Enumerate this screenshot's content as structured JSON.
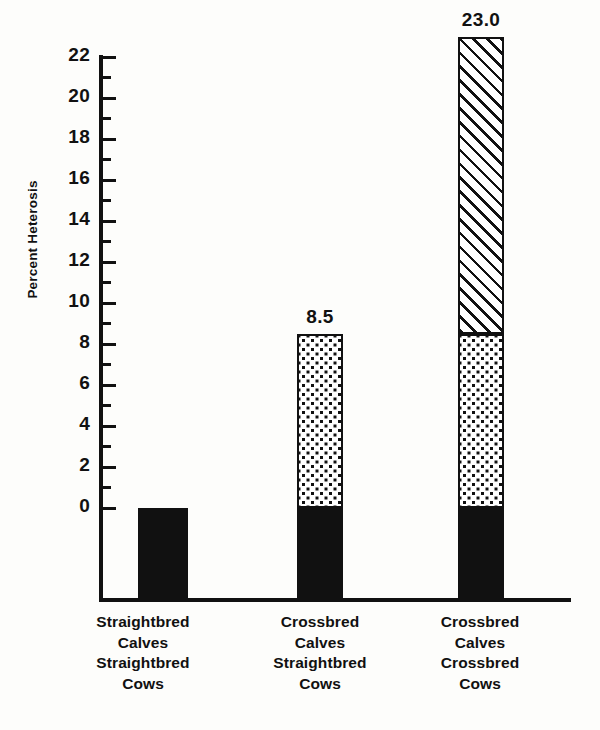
{
  "chart_data": {
    "type": "bar",
    "title": "",
    "subtitle": "",
    "xlabel": "",
    "ylabel": "Percent Heterosis",
    "ylim": [
      0,
      23
    ],
    "grid": false,
    "legend": "none",
    "stacked": true,
    "categories": [
      "Straightbred Calves Straightbred Cows",
      "Crossbred Calves Straightbred Cows",
      "Crossbred Calves Crossbred Cows"
    ],
    "category_lines": [
      [
        "Straightbred",
        "Calves",
        "Straightbred",
        "Cows"
      ],
      [
        "Crossbred",
        "Calves",
        "Straightbred",
        "Cows"
      ],
      [
        "Crossbred",
        "Calves",
        "Crossbred",
        "Cows"
      ]
    ],
    "values": [
      0.0,
      8.5,
      23.0
    ],
    "value_labels": [
      "",
      "8.5",
      "23.0"
    ],
    "series": [
      {
        "name": "individual heterosis (calf)",
        "fill": "dotted",
        "values": [
          0.0,
          8.5,
          8.5
        ]
      },
      {
        "name": "maternal heterosis (cow)",
        "fill": "hatched",
        "values": [
          0.0,
          0.0,
          14.5
        ]
      }
    ],
    "y_ticks_major": [
      0,
      2,
      4,
      6,
      8,
      10,
      12,
      14,
      16,
      18,
      20,
      22
    ],
    "y_ticks_minor": [
      1,
      3,
      5,
      7,
      9,
      11,
      13,
      15,
      17,
      19,
      21
    ],
    "y_tick_labels": [
      "0",
      "2",
      "4",
      "6",
      "8",
      "10",
      "12",
      "14",
      "16",
      "18",
      "20",
      "22"
    ],
    "colors": {
      "ink": "#111111",
      "background": "#fdfdfb",
      "fill_solid": "#111111",
      "fill_pattern_background": "#ffffff"
    }
  }
}
